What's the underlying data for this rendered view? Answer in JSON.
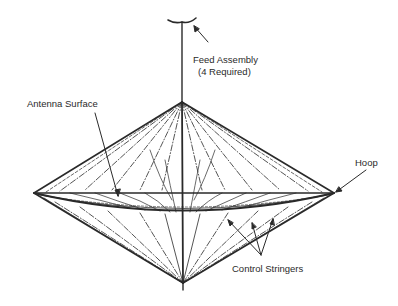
{
  "diagram": {
    "labels": {
      "feed_assembly": "Feed Assembly",
      "feed_assembly_note": "(4 Required)",
      "antenna_surface": "Antenna Surface",
      "hoop": "Hoop",
      "control_stringers": "Control Stringers"
    },
    "colors": {
      "line": "#2a2a2a",
      "background": "#ffffff"
    }
  }
}
